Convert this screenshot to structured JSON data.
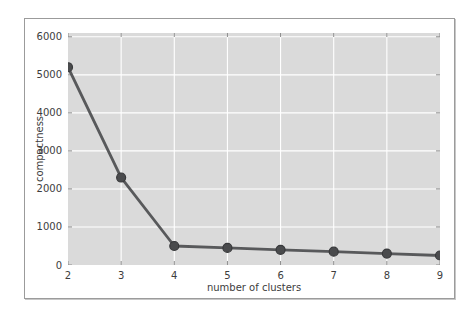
{
  "figure": {
    "background": "#ffffff",
    "border_color": "#9b9b9b"
  },
  "chart_data": {
    "type": "line",
    "title": "",
    "xlabel": "number of clusters",
    "ylabel": "compactness",
    "x": [
      2,
      3,
      4,
      5,
      6,
      7,
      8,
      9
    ],
    "values": [
      5200,
      2300,
      500,
      450,
      400,
      350,
      300,
      250
    ],
    "xlim": [
      2,
      9
    ],
    "ylim": [
      0,
      6100
    ],
    "x_ticks": [
      2,
      3,
      4,
      5,
      6,
      7,
      8,
      9
    ],
    "x_tick_labels": [
      "2",
      "3",
      "4",
      "5",
      "6",
      "7",
      "8",
      "9"
    ],
    "y_ticks": [
      0,
      1000,
      2000,
      3000,
      4000,
      5000,
      6000
    ],
    "y_tick_labels": [
      "0",
      "1000",
      "2000",
      "3000",
      "4000",
      "5000",
      "6000"
    ],
    "grid": true,
    "legend_position": "none",
    "colors": {
      "plot_background": "#dadada",
      "gridline": "#ffffff",
      "tick_mark": "#8a8a8a",
      "line": "#58595b",
      "marker_fill": "#4a4b4d",
      "marker_edge": "#38393b",
      "text": "#3d3d3d"
    }
  }
}
